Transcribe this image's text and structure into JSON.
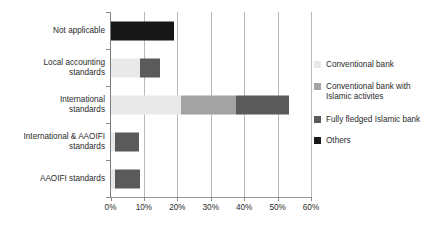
{
  "chart_data": {
    "type": "bar",
    "orientation": "horizontal",
    "stacked": true,
    "title": "",
    "xlabel": "",
    "ylabel": "",
    "xlim": [
      0,
      60
    ],
    "xticks": [
      0,
      10,
      20,
      30,
      40,
      50,
      60
    ],
    "xtick_labels": [
      "0%",
      "10%",
      "20%",
      "30%",
      "40%",
      "50%",
      "60%"
    ],
    "grid": "vertical",
    "legend_position": "right",
    "categories": [
      "Not applicable",
      "Local accounting\nstandards",
      "International\nstandards",
      "International & AAOIFI\nstandards",
      "AAOIFI standards"
    ],
    "series": [
      {
        "name": "Conventional bank",
        "color": "#e9e9e9",
        "values": [
          0,
          8.8,
          21.2,
          1.2,
          1.4
        ]
      },
      {
        "name": "Conventional bank with\nIslamic activites",
        "color": "#a3a3a3",
        "values": [
          0,
          0,
          16.4,
          0,
          0
        ]
      },
      {
        "name": "Fully fledged Islamic bank",
        "color": "#5a5a5a",
        "values": [
          0,
          5.9,
          15.8,
          7.3,
          7.5
        ]
      },
      {
        "name": "Others",
        "color": "#171717",
        "values": [
          18.9,
          0,
          0,
          0,
          0
        ]
      }
    ],
    "totals": [
      18.9,
      14.7,
      53.4,
      8.5,
      8.9
    ]
  },
  "legend": {
    "items": [
      {
        "label": "Conventional bank",
        "color": "#e9e9e9"
      },
      {
        "label": "Conventional bank with\nIslamic activites",
        "color": "#a3a3a3"
      },
      {
        "label": "Fully fledged Islamic bank",
        "color": "#5a5a5a"
      },
      {
        "label": "Others",
        "color": "#171717"
      }
    ]
  },
  "axis": {
    "gridline_color": "#b9b9b9",
    "axis_color": "#8a8a8a"
  }
}
